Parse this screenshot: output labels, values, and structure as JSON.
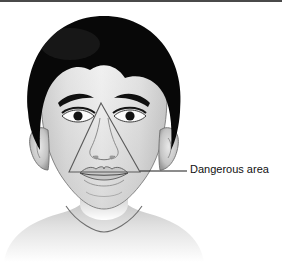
{
  "figure": {
    "width": 282,
    "height": 262,
    "background_color": "#ffffff",
    "top_rule_color": "#4a4a4a"
  },
  "annotation": {
    "label": "Dangerous area",
    "text_color": "#111111",
    "leader_line_color": "#1a1a1a",
    "leader_start_x": 140,
    "leader_start_y": 171,
    "leader_end_x": 187,
    "leader_end_y": 171
  },
  "overlay": {
    "shape": "triangle",
    "name": "danger-triangle",
    "stroke_color": "#5a5a5a",
    "apex_x": 101,
    "apex_y": 103,
    "base_left_x": 69,
    "base_left_y": 172,
    "base_right_x": 140,
    "base_right_y": 172
  },
  "illustration": {
    "subject": "front-facing child head and shoulders",
    "hair_color": "#080808",
    "skin_light": "#f2f2f2",
    "skin_mid": "#d2d2d2",
    "skin_shadow": "#a8a8a8",
    "outline_color": "#6e6e6e",
    "eye_color": "#121212",
    "parts": [
      "hair",
      "forehead",
      "left-eyebrow",
      "right-eyebrow",
      "left-eye",
      "right-eye",
      "nose",
      "mouth",
      "chin",
      "left-ear",
      "right-ear",
      "neck",
      "shoulders"
    ]
  }
}
